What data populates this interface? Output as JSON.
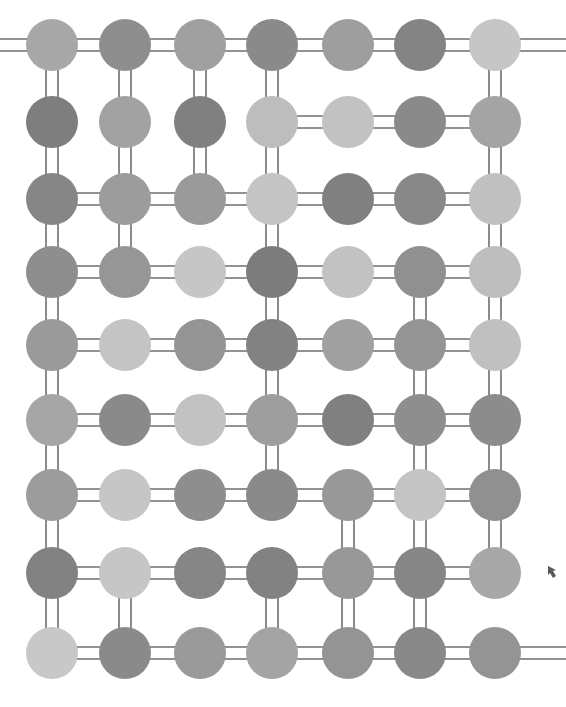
{
  "figure": {
    "background_color": "#ffffff",
    "width": 566,
    "height": 707
  },
  "style": {
    "node_radius": 26,
    "bond_color": "#6e6e6e",
    "bond_width": 1.6,
    "rail_gap": 12,
    "marker_color": "#5a5a5a"
  },
  "palette": {
    "lightest": "#cdcdcd",
    "lighter": "#bdbdbd",
    "light": "#b0b0b0",
    "medium_light": "#a5a5a5",
    "medium": "#9a9a9a",
    "medium_dark": "#8c8c8c",
    "dark": "#808080",
    "darker": "#747474"
  },
  "grid": {
    "columns": 7,
    "rows": 9,
    "column_x": [
      52,
      125,
      200,
      272,
      348,
      420,
      495
    ],
    "row_y": [
      45,
      122,
      199,
      272,
      345,
      420,
      495,
      573,
      653
    ]
  },
  "nodes": [
    [
      {
        "col": 1,
        "shade": "#a8a8a8"
      },
      {
        "col": 2,
        "shade": "#8e8e8e"
      },
      {
        "col": 3,
        "shade": "#a0a0a0"
      },
      {
        "col": 4,
        "shade": "#8a8a8a"
      },
      {
        "col": 5,
        "shade": "#9e9e9e"
      },
      {
        "col": 6,
        "shade": "#848484"
      },
      {
        "col": 7,
        "shade": "#c6c6c6"
      }
    ],
    [
      {
        "col": 1,
        "shade": "#7e7e7e"
      },
      {
        "col": 2,
        "shade": "#a2a2a2"
      },
      {
        "col": 3,
        "shade": "#808080"
      },
      {
        "col": 4,
        "shade": "#bdbdbd"
      },
      {
        "col": 5,
        "shade": "#c2c2c2"
      },
      {
        "col": 6,
        "shade": "#8a8a8a"
      },
      {
        "col": 7,
        "shade": "#a4a4a4"
      }
    ],
    [
      {
        "col": 1,
        "shade": "#868686"
      },
      {
        "col": 2,
        "shade": "#9c9c9c"
      },
      {
        "col": 3,
        "shade": "#9a9a9a"
      },
      {
        "col": 4,
        "shade": "#c4c4c4"
      },
      {
        "col": 5,
        "shade": "#808080"
      },
      {
        "col": 6,
        "shade": "#888888"
      },
      {
        "col": 7,
        "shade": "#c0c0c0"
      }
    ],
    [
      {
        "col": 1,
        "shade": "#8e8e8e"
      },
      {
        "col": 2,
        "shade": "#969696"
      },
      {
        "col": 3,
        "shade": "#c6c6c6"
      },
      {
        "col": 4,
        "shade": "#7c7c7c"
      },
      {
        "col": 5,
        "shade": "#c2c2c2"
      },
      {
        "col": 6,
        "shade": "#909090"
      },
      {
        "col": 7,
        "shade": "#bebebe"
      }
    ],
    [
      {
        "col": 1,
        "shade": "#9a9a9a"
      },
      {
        "col": 2,
        "shade": "#c4c4c4"
      },
      {
        "col": 3,
        "shade": "#949494"
      },
      {
        "col": 4,
        "shade": "#828282"
      },
      {
        "col": 5,
        "shade": "#a0a0a0"
      },
      {
        "col": 6,
        "shade": "#949494"
      },
      {
        "col": 7,
        "shade": "#c0c0c0"
      }
    ],
    [
      {
        "col": 1,
        "shade": "#a6a6a6"
      },
      {
        "col": 2,
        "shade": "#8a8a8a"
      },
      {
        "col": 3,
        "shade": "#c2c2c2"
      },
      {
        "col": 4,
        "shade": "#9e9e9e"
      },
      {
        "col": 5,
        "shade": "#808080"
      },
      {
        "col": 6,
        "shade": "#8e8e8e"
      },
      {
        "col": 7,
        "shade": "#8c8c8c"
      }
    ],
    [
      {
        "col": 1,
        "shade": "#9c9c9c"
      },
      {
        "col": 2,
        "shade": "#c6c6c6"
      },
      {
        "col": 3,
        "shade": "#8e8e8e"
      },
      {
        "col": 4,
        "shade": "#8a8a8a"
      },
      {
        "col": 5,
        "shade": "#989898"
      },
      {
        "col": 6,
        "shade": "#c4c4c4"
      },
      {
        "col": 7,
        "shade": "#909090"
      }
    ],
    [
      {
        "col": 1,
        "shade": "#828282"
      },
      {
        "col": 2,
        "shade": "#c6c6c6"
      },
      {
        "col": 3,
        "shade": "#868686"
      },
      {
        "col": 4,
        "shade": "#828282"
      },
      {
        "col": 5,
        "shade": "#989898"
      },
      {
        "col": 6,
        "shade": "#868686"
      },
      {
        "col": 7,
        "shade": "#a8a8a8"
      }
    ],
    [
      {
        "col": 1,
        "shade": "#c8c8c8"
      },
      {
        "col": 2,
        "shade": "#8a8a8a"
      },
      {
        "col": 3,
        "shade": "#9a9a9a"
      },
      {
        "col": 4,
        "shade": "#a4a4a4"
      },
      {
        "col": 5,
        "shade": "#949494"
      },
      {
        "col": 6,
        "shade": "#888888"
      },
      {
        "col": 7,
        "shade": "#949494"
      }
    ]
  ],
  "horizontal_bonds": [
    {
      "row": 1,
      "spans": [
        [
          0,
          1
        ],
        [
          1,
          2
        ],
        [
          2,
          3
        ],
        [
          3,
          4
        ],
        [
          4,
          5
        ],
        [
          5,
          6
        ]
      ],
      "extend_left": true,
      "extend_right": true
    },
    {
      "row": 2,
      "spans": [
        [
          3,
          4
        ],
        [
          4,
          5
        ],
        [
          5,
          6
        ]
      ],
      "extend_left": false,
      "extend_right": false
    },
    {
      "row": 3,
      "spans": [
        [
          0,
          1
        ],
        [
          1,
          2
        ],
        [
          2,
          3
        ],
        [
          3,
          4
        ],
        [
          4,
          5
        ],
        [
          5,
          6
        ]
      ],
      "extend_left": false,
      "extend_right": false
    },
    {
      "row": 4,
      "spans": [
        [
          0,
          1
        ],
        [
          1,
          2
        ],
        [
          2,
          3
        ],
        [
          3,
          4
        ],
        [
          4,
          5
        ],
        [
          5,
          6
        ]
      ],
      "extend_left": false,
      "extend_right": false
    },
    {
      "row": 5,
      "spans": [
        [
          0,
          1
        ],
        [
          1,
          2
        ],
        [
          2,
          3
        ],
        [
          3,
          4
        ],
        [
          4,
          5
        ],
        [
          5,
          6
        ]
      ],
      "extend_left": false,
      "extend_right": false
    },
    {
      "row": 6,
      "spans": [
        [
          0,
          1
        ],
        [
          1,
          2
        ],
        [
          2,
          3
        ],
        [
          3,
          4
        ],
        [
          4,
          5
        ],
        [
          5,
          6
        ]
      ],
      "extend_left": false,
      "extend_right": false
    },
    {
      "row": 7,
      "spans": [
        [
          0,
          1
        ],
        [
          1,
          2
        ],
        [
          2,
          3
        ],
        [
          3,
          4
        ],
        [
          4,
          5
        ],
        [
          5,
          6
        ]
      ],
      "extend_left": false,
      "extend_right": false
    },
    {
      "row": 8,
      "spans": [
        [
          0,
          1
        ],
        [
          1,
          2
        ],
        [
          2,
          3
        ],
        [
          3,
          4
        ],
        [
          4,
          5
        ],
        [
          5,
          6
        ]
      ],
      "extend_left": false,
      "extend_right": false
    },
    {
      "row": 9,
      "spans": [
        [
          0,
          1
        ],
        [
          1,
          2
        ],
        [
          2,
          3
        ],
        [
          3,
          4
        ],
        [
          4,
          5
        ],
        [
          5,
          6
        ]
      ],
      "extend_left": false,
      "extend_right": true
    }
  ],
  "vertical_bonds": [
    {
      "gap": [
        1,
        2
      ],
      "columns": [
        0,
        1,
        2,
        3,
        6
      ]
    },
    {
      "gap": [
        2,
        3
      ],
      "columns": [
        0,
        1,
        2,
        3,
        6
      ]
    },
    {
      "gap": [
        3,
        4
      ],
      "columns": [
        0,
        1,
        3,
        6
      ]
    },
    {
      "gap": [
        4,
        5
      ],
      "columns": [
        0,
        3,
        5,
        6
      ]
    },
    {
      "gap": [
        5,
        6
      ],
      "columns": [
        0,
        3,
        5,
        6
      ]
    },
    {
      "gap": [
        6,
        7
      ],
      "columns": [
        0,
        3,
        5,
        6
      ]
    },
    {
      "gap": [
        7,
        8
      ],
      "columns": [
        0,
        4,
        5,
        6
      ]
    },
    {
      "gap": [
        8,
        9
      ],
      "columns": [
        0,
        1,
        3,
        4,
        5
      ]
    }
  ],
  "markers": [
    {
      "name": "right-edge-tick",
      "x": 548,
      "y": 566
    }
  ]
}
